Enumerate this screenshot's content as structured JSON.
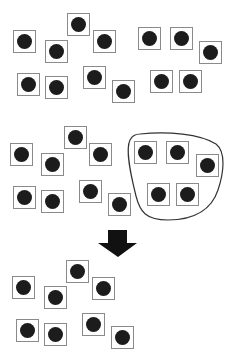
{
  "diagram": {
    "colors": {
      "square_border": "#8a8a8a",
      "dot": "#1c1c1c",
      "outline": "#333333",
      "arrow": "#111111",
      "background": "#ffffff"
    },
    "panels": [
      {
        "id": "top",
        "squares": [
          [
            13,
            30
          ],
          [
            45,
            40
          ],
          [
            67,
            13
          ],
          [
            93,
            30
          ],
          [
            17,
            73
          ],
          [
            45,
            76
          ],
          [
            83,
            66
          ],
          [
            112,
            80
          ],
          [
            138,
            27
          ],
          [
            170,
            27
          ],
          [
            199,
            41
          ],
          [
            150,
            70
          ],
          [
            179,
            70
          ]
        ]
      },
      {
        "id": "middle",
        "squares": [
          [
            10,
            143
          ],
          [
            41,
            153
          ],
          [
            64,
            126
          ],
          [
            89,
            143
          ],
          [
            13,
            186
          ],
          [
            41,
            190
          ],
          [
            79,
            180
          ],
          [
            108,
            193
          ]
        ],
        "grouped_squares": [
          [
            134,
            141
          ],
          [
            166,
            141
          ],
          [
            196,
            154
          ],
          [
            147,
            183
          ],
          [
            176,
            183
          ]
        ],
        "group_outline": {
          "shape": "closed-blob",
          "bbox": [
            127,
            133,
            222,
            220
          ]
        }
      },
      {
        "id": "bottom",
        "squares": [
          [
            12,
            276
          ],
          [
            44,
            286
          ],
          [
            66,
            260
          ],
          [
            92,
            277
          ],
          [
            16,
            319
          ],
          [
            44,
            323
          ],
          [
            82,
            313
          ],
          [
            111,
            326
          ]
        ]
      }
    ],
    "arrow": {
      "direction": "down",
      "shaft": [
        108,
        230,
        127,
        243
      ],
      "head": [
        98,
        243,
        137,
        243,
        118,
        257
      ]
    }
  }
}
